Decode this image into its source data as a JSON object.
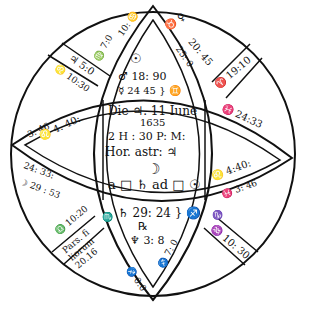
{
  "chart": {
    "stroke_color": "#111111",
    "background": "#ffffff"
  },
  "center": {
    "date": "Die ♃. 11 Iune",
    "year": "1635",
    "time": "2 H : 30  P: M:",
    "hora": "Hor. astr: ♃",
    "moon": "☽",
    "aspect": "a □ ♄ ad □ ☉"
  },
  "houses": {
    "h10_top_left_band": "♃ 5:0",
    "h10_top_left_inner": "♌ 10:30",
    "h10_cusp_left": "♍ 7:0",
    "h10_cusp_top": "10: ♋",
    "h11_cusp": "♉ ♀",
    "h11_band_outer": "20: 45",
    "h11_band_inner": "25: 0",
    "h12_box": "♈ 19:10",
    "top_planets": [
      {
        "symbol": "☉",
        "value": ""
      },
      {
        "symbol": "♂",
        "value": "18: 90"
      },
      {
        "symbol": "☿",
        "value": "24  45 } ♊"
      }
    ],
    "h1_band_outer": "♓ 24:33",
    "h1_band_inner": "♌ 4:40:",
    "h1_band_lower": "♓ 3: 46",
    "h9_band_outer": "3: 46",
    "h9_band_inner": "♌ 4. 40:",
    "h9_cusp": "♍",
    "h7_cusp": "♍",
    "h7_band": "24: 33:",
    "h7_band_inner": "☽ 29 : 53",
    "h6_box": "♎ 10:20",
    "pars_fortunae": "Pars. fi liorum 20.16",
    "h5_cusp": "♏",
    "bottom_planets": [
      {
        "symbol": "♄",
        "value": "29: 24 } ♐"
      },
      {
        "symbol": "℞",
        "value": ""
      },
      {
        "symbol": "♆",
        "value": "3: 8"
      }
    ],
    "h4_band_left": "♐ 0:0",
    "h4_band_right": "♐ 7: 0",
    "h4_cusp": "♑",
    "h3_box": "♒ 10: 30"
  }
}
